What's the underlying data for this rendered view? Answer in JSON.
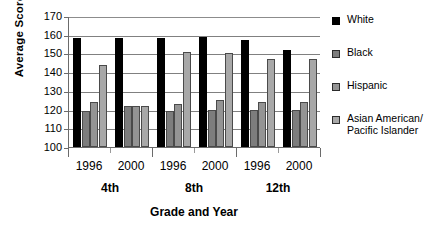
{
  "chart_data": {
    "type": "bar",
    "title": "",
    "xlabel": "Grade and Year",
    "ylabel": "Average Score",
    "ylim": [
      100,
      170
    ],
    "ytick_step": 10,
    "yticks": [
      170,
      160,
      150,
      140,
      130,
      120,
      110,
      100
    ],
    "grid": true,
    "legend_position": "right",
    "categories": [
      "1996",
      "2000",
      "1996",
      "2000",
      "1996",
      "2000"
    ],
    "group_labels": [
      "4th",
      "8th",
      "12th"
    ],
    "series": [
      {
        "name": "White",
        "color": "#000000",
        "values": [
          158,
          158,
          158,
          159,
          157,
          152
        ]
      },
      {
        "name": "Black",
        "color": "#7d7d7d",
        "values": [
          119,
          122,
          119,
          120,
          120,
          120
        ]
      },
      {
        "name": "Hispanic",
        "color": "#949494",
        "values": [
          124,
          122,
          123,
          125,
          124,
          124
        ]
      },
      {
        "name": "Asian American/ Pacific Islander",
        "color": "#a8a8a8",
        "values": [
          144,
          122,
          151,
          150,
          147,
          147
        ]
      }
    ]
  },
  "legend": {
    "items": [
      {
        "label": "White"
      },
      {
        "label": "Black"
      },
      {
        "label": "Hispanic"
      },
      {
        "label": "Asian American/"
      },
      {
        "label": "Pacific Islander"
      }
    ]
  },
  "axis": {
    "y_title": "Average Score",
    "x_title": "Grade and Year",
    "y_ticks": [
      "170",
      "160",
      "150",
      "140",
      "130",
      "120",
      "110",
      "100"
    ],
    "x_years": [
      "1996",
      "2000",
      "1996",
      "2000",
      "1996",
      "2000"
    ],
    "x_grades": [
      "4th",
      "8th",
      "12th"
    ]
  }
}
